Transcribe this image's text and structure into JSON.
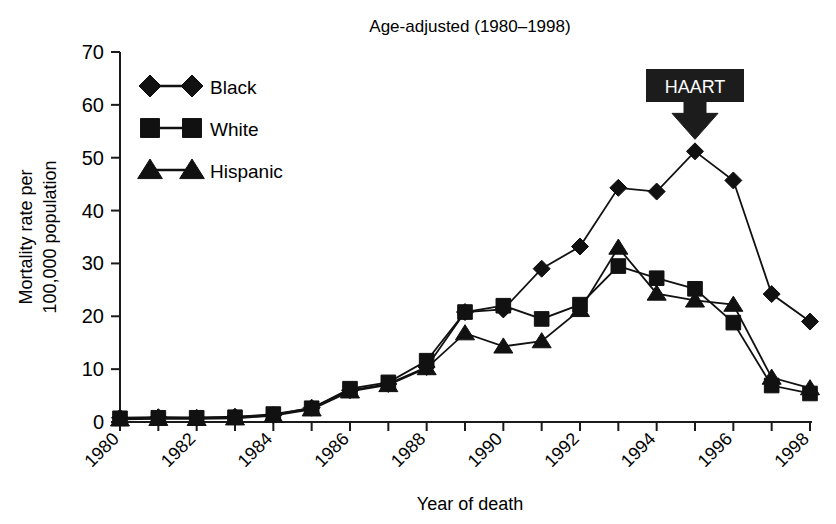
{
  "chart_data": {
    "type": "line",
    "title": "Age-adjusted (1980–1998)",
    "xlabel": "Year of death",
    "ylabel": "Mortality rate per\n100,000 population",
    "ylabel_line1": "Mortality rate per",
    "ylabel_line2": "100,000 population",
    "x": [
      1980,
      1981,
      1982,
      1983,
      1984,
      1985,
      1986,
      1987,
      1988,
      1989,
      1990,
      1991,
      1992,
      1993,
      1994,
      1995,
      1996,
      1997,
      1998
    ],
    "xlim": [
      1980,
      1998
    ],
    "ylim": [
      0,
      70
    ],
    "ytick_values": [
      0,
      10,
      20,
      30,
      40,
      50,
      60,
      70
    ],
    "ytick_labels": [
      "0",
      "10",
      "20",
      "30",
      "40",
      "50",
      "60",
      "70"
    ],
    "xtick_values": [
      1980,
      1981,
      1982,
      1983,
      1984,
      1985,
      1986,
      1987,
      1988,
      1989,
      1990,
      1991,
      1992,
      1993,
      1994,
      1995,
      1996,
      1997,
      1998
    ],
    "xtick_labels": [
      "1980",
      "",
      "1982",
      "",
      "1984",
      "",
      "1986",
      "",
      "1988",
      "",
      "1990",
      "",
      "1992",
      "",
      "1994",
      "",
      "1996",
      "",
      "1998"
    ],
    "grid": false,
    "legend_position": "upper-left",
    "series": [
      {
        "name": "Black",
        "marker": "diamond",
        "color": "#111111",
        "values": [
          0.8,
          0.9,
          0.8,
          1.0,
          1.3,
          2.7,
          6.0,
          7.2,
          10.4,
          20.8,
          21.3,
          29.0,
          33.2,
          44.3,
          43.6,
          51.2,
          45.7,
          24.2,
          19.0
        ]
      },
      {
        "name": "White",
        "marker": "square",
        "color": "#111111",
        "values": [
          0.7,
          0.8,
          0.8,
          0.9,
          1.5,
          2.6,
          6.3,
          7.5,
          11.6,
          20.8,
          22.0,
          19.5,
          22.2,
          29.5,
          27.2,
          25.2,
          18.8,
          6.9,
          5.4
        ]
      },
      {
        "name": "Hispanic",
        "marker": "triangle",
        "color": "#111111",
        "values": [
          0.5,
          0.6,
          0.6,
          0.7,
          1.2,
          2.4,
          5.8,
          7.0,
          10.2,
          16.8,
          14.3,
          15.3,
          21.2,
          33.0,
          24.3,
          23.0,
          22.2,
          8.4,
          6.4
        ]
      }
    ],
    "annotations": [
      {
        "label": "HAART",
        "type": "boxed-arrow",
        "points_to_year": 1995,
        "points_to_value": 51.2,
        "box_fill": "#1c1c1c",
        "text_color": "#ffffff"
      }
    ]
  },
  "legend": {
    "items": [
      {
        "label": "Black",
        "marker": "diamond"
      },
      {
        "label": "White",
        "marker": "square"
      },
      {
        "label": "Hispanic",
        "marker": "triangle"
      }
    ]
  }
}
